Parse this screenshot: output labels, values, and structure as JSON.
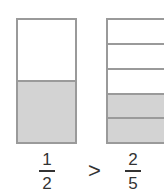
{
  "figure": {
    "left_model": {
      "parts": 2,
      "shaded": 1,
      "fraction": {
        "numerator": "1",
        "denominator": "2"
      }
    },
    "right_model": {
      "parts": 5,
      "shaded": 2,
      "fraction": {
        "numerator": "2",
        "denominator": "5"
      }
    },
    "comparison": ">"
  },
  "colors": {
    "border": "#9a9a9a",
    "shade": "#d3d3d3",
    "text": "#333333"
  }
}
